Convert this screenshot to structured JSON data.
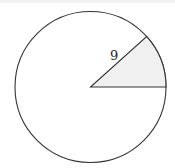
{
  "diagram": {
    "type": "circle-sector",
    "circle": {
      "cx": 90.5,
      "cy": 87,
      "r": 75.5,
      "stroke": "#333333",
      "fill": "#ffffff"
    },
    "sector": {
      "start_angle_deg": 0,
      "end_angle_deg": 42,
      "fill": "#f0f0f0",
      "stroke": "#333333"
    },
    "radius_label": "9",
    "label_pos": {
      "x": 110,
      "y": 60
    }
  }
}
